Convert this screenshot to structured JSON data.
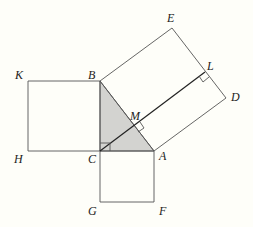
{
  "diagram": {
    "colors": {
      "background": "#fefef9",
      "line": "#555555",
      "shade": "#d3d3d0",
      "text": "#222222"
    },
    "points": {
      "A": {
        "label": "A",
        "x": 154,
        "y": 151
      },
      "B": {
        "label": "B",
        "x": 100,
        "y": 81
      },
      "C": {
        "label": "C",
        "x": 100,
        "y": 151
      },
      "D": {
        "label": "D",
        "x": 226,
        "y": 98
      },
      "E": {
        "label": "E",
        "x": 172,
        "y": 28
      },
      "F": {
        "label": "F",
        "x": 154,
        "y": 202
      },
      "G": {
        "label": "G",
        "x": 100,
        "y": 202
      },
      "H": {
        "label": "H",
        "x": 28,
        "y": 151
      },
      "K": {
        "label": "K",
        "x": 28,
        "y": 81
      },
      "L": {
        "label": "L",
        "x": 205,
        "y": 72
      },
      "M": {
        "label": "M",
        "x": 135,
        "y": 126
      }
    },
    "labels": {
      "A": "A",
      "B": "B",
      "C": "C",
      "D": "D",
      "E": "E",
      "F": "F",
      "G": "G",
      "H": "H",
      "K": "K",
      "L": "L",
      "M": "M"
    },
    "shapes": [
      {
        "name": "triangle ABC",
        "shaded": true
      },
      {
        "name": "square BCHK"
      },
      {
        "name": "square CAFG"
      },
      {
        "name": "square ABED"
      },
      {
        "name": "segment CL",
        "perpendicular_to": "AB",
        "foot": "M"
      }
    ],
    "right_angle_marks": [
      "C",
      "M",
      "L"
    ]
  }
}
